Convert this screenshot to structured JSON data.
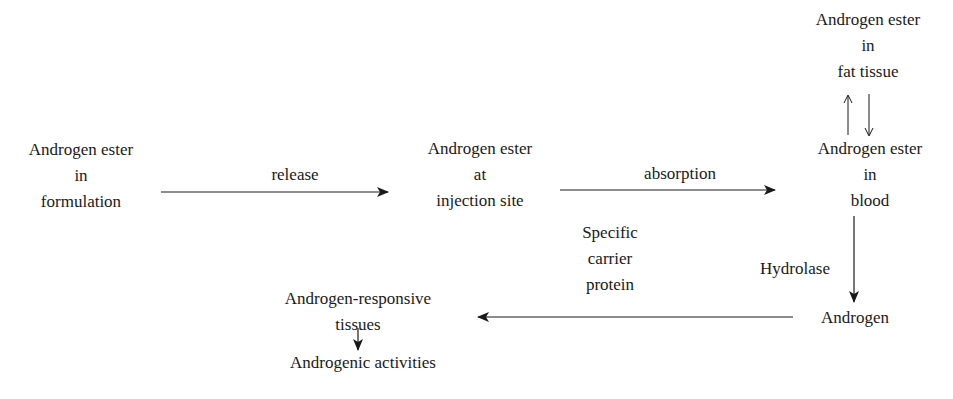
{
  "diagram": {
    "nodes": {
      "formulation": {
        "lines": [
          "Androgen ester",
          "in",
          "formulation"
        ]
      },
      "injection_site": {
        "lines": [
          "Androgen ester",
          "at",
          "injection site"
        ]
      },
      "fat_tissue": {
        "lines": [
          "Androgen ester",
          "in",
          "fat tissue"
        ]
      },
      "blood": {
        "lines": [
          "Androgen ester",
          "in",
          "blood"
        ]
      },
      "androgen": {
        "lines": [
          "Androgen"
        ]
      },
      "responsive_tissues": {
        "lines": [
          "Androgen-responsive",
          "tissues"
        ]
      },
      "activities": {
        "lines": [
          "Androgenic activities"
        ]
      }
    },
    "edges": {
      "release": {
        "label": "release"
      },
      "absorption": {
        "label": "absorption"
      },
      "hydrolase": {
        "label": "Hydrolase"
      },
      "carrier": {
        "lines": [
          "Specific",
          "carrier",
          "protein"
        ]
      }
    }
  }
}
